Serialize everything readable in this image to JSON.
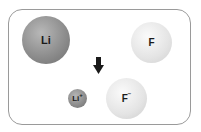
{
  "diagram": {
    "before": {
      "lithium": {
        "symbol": "Li",
        "charge": ""
      },
      "fluorine": {
        "symbol": "F",
        "charge": ""
      }
    },
    "after": {
      "lithium_ion": {
        "symbol": "Li",
        "charge": "+"
      },
      "fluoride_ion": {
        "symbol": "F",
        "charge": "−"
      }
    },
    "arrow": "down-arrow",
    "colors": {
      "lithium": "#8e8e8e",
      "fluorine": "#e4e4e4",
      "frame": "#9a9a9a"
    }
  }
}
